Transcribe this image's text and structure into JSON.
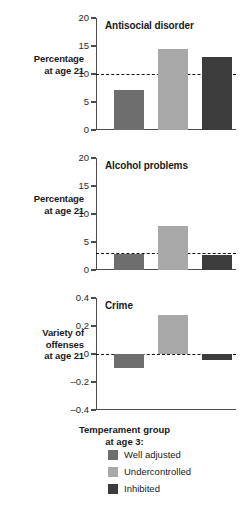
{
  "chart_data": {
    "type": "bar",
    "categories": [
      "Well adjusted",
      "Undercontrolled",
      "Inhibited"
    ],
    "colors": [
      "#6e6e6e",
      "#a8a8a8",
      "#3c3c3c"
    ],
    "legend_position": "bottom",
    "grid": false,
    "xlabel": "Temperament group at age 3:",
    "panels": [
      {
        "title": "Antisocial disorder",
        "ylabel": "Percentage at age 21",
        "values": [
          7.2,
          14.5,
          13.0
        ],
        "ylim": [
          0,
          20
        ],
        "yticks": [
          0,
          5,
          10,
          15,
          20
        ],
        "yticklabels": [
          "0",
          "5",
          "10",
          "15",
          "20"
        ],
        "reference_line": 10
      },
      {
        "title": "Alcohol problems",
        "ylabel": "Percentage at age 21",
        "values": [
          2.8,
          7.9,
          2.7
        ],
        "ylim": [
          0,
          20
        ],
        "yticks": [
          0,
          5,
          10,
          15,
          20
        ],
        "yticklabels": [
          "0",
          "5",
          "10",
          "15",
          "20"
        ],
        "reference_line": 3
      },
      {
        "title": "Crime",
        "ylabel": "Variety of offenses at age 21",
        "values": [
          -0.1,
          0.28,
          -0.045
        ],
        "ylim": [
          -0.4,
          0.4
        ],
        "yticks": [
          -0.4,
          -0.2,
          0,
          0.2,
          0.4
        ],
        "yticklabels": [
          "–0.4",
          "–0.2",
          "0",
          "0.2",
          "0.4"
        ],
        "reference_line": 0
      }
    ]
  },
  "caption": {
    "line1": "Temperament group",
    "line2": "at age 3:"
  },
  "legend": {
    "items": [
      {
        "label": "Well adjusted",
        "color": "#6e6e6e"
      },
      {
        "label": "Undercontrolled",
        "color": "#a8a8a8"
      },
      {
        "label": "Inhibited",
        "color": "#3c3c3c"
      }
    ]
  },
  "ylabels": {
    "p0_line1": "Percentage",
    "p0_line2": "at age 21",
    "p1_line1": "Percentage",
    "p1_line2": "at age 21",
    "p2_line1": "Variety of",
    "p2_line2": "offenses",
    "p2_line3": "at age 21"
  }
}
